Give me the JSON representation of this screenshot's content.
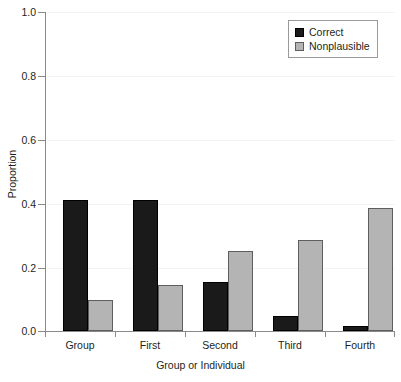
{
  "chart_data": {
    "type": "bar",
    "title": "",
    "xlabel": "Group or Individual",
    "ylabel": "Proportion",
    "categories": [
      "Group",
      "First",
      "Second",
      "Third",
      "Fourth"
    ],
    "series": [
      {
        "name": "Correct",
        "color": "#1a1a1a",
        "values": [
          0.41,
          0.41,
          0.155,
          0.048,
          0.016
        ]
      },
      {
        "name": "Nonplausible",
        "color": "#b4b4b4",
        "values": [
          0.098,
          0.145,
          0.25,
          0.286,
          0.386
        ]
      }
    ],
    "ylim": [
      0.0,
      1.0
    ],
    "yticks": [
      "0.0",
      "0.2",
      "0.4",
      "0.6",
      "0.8",
      "1.0"
    ],
    "ytick_values": [
      0.0,
      0.2,
      0.4,
      0.6,
      0.8,
      1.0
    ],
    "grid": "faint-horizontal",
    "legend_position": "top-right",
    "legend_entries": [
      "Correct",
      "Nonplausible"
    ]
  }
}
